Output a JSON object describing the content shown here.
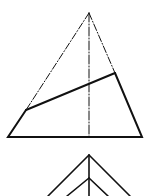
{
  "diagram": {
    "type": "technical-projection-drawing",
    "stroke_color": "#111111",
    "background": "#ffffff",
    "upper_figure": {
      "description": "Front view of a truncated pyramid with an inclined cutting plane",
      "apex": [
        89,
        13
      ],
      "base_left": [
        8,
        137
      ],
      "base_right": [
        142,
        137
      ],
      "cut_left": [
        26,
        110
      ],
      "cut_right": [
        115,
        73
      ],
      "axis": {
        "x": 89,
        "y_top": 13,
        "y_bottom": 137
      }
    },
    "lower_figure": {
      "description": "Top view (partial) of pyramid with nested edges",
      "outer_apex": [
        89,
        155
      ],
      "inner_apex": [
        89,
        178
      ],
      "axis": {
        "x": 89,
        "y_top": 155,
        "y_bottom": 196
      }
    }
  }
}
